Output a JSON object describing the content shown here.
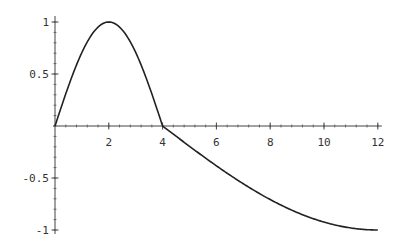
{
  "chart_data": {
    "type": "line",
    "title": "",
    "xlabel": "",
    "ylabel": "",
    "xlim": [
      0,
      12
    ],
    "ylim": [
      -1,
      1
    ],
    "grid": false,
    "legend": null,
    "x_ticks": [
      2,
      4,
      6,
      8,
      10,
      12
    ],
    "x_tick_labels": [
      "2",
      "4",
      "6",
      "8",
      "10",
      "12"
    ],
    "y_ticks": [
      1,
      0.5,
      -0.5,
      -1
    ],
    "y_tick_labels": [
      "1",
      "0.5",
      "-0.5",
      "-1"
    ],
    "series": [
      {
        "name": "piecewise curve",
        "color": "#222222",
        "x": [
          0,
          0.5,
          1,
          1.5,
          2,
          2.5,
          3,
          3.5,
          4,
          5,
          6,
          7,
          8,
          9,
          10,
          11,
          12
        ],
        "y": [
          0,
          0.38,
          0.71,
          0.92,
          1.0,
          0.92,
          0.71,
          0.38,
          0,
          -0.2,
          -0.38,
          -0.56,
          -0.71,
          -0.83,
          -0.92,
          -0.98,
          -1.0
        ]
      }
    ],
    "annotations": []
  }
}
